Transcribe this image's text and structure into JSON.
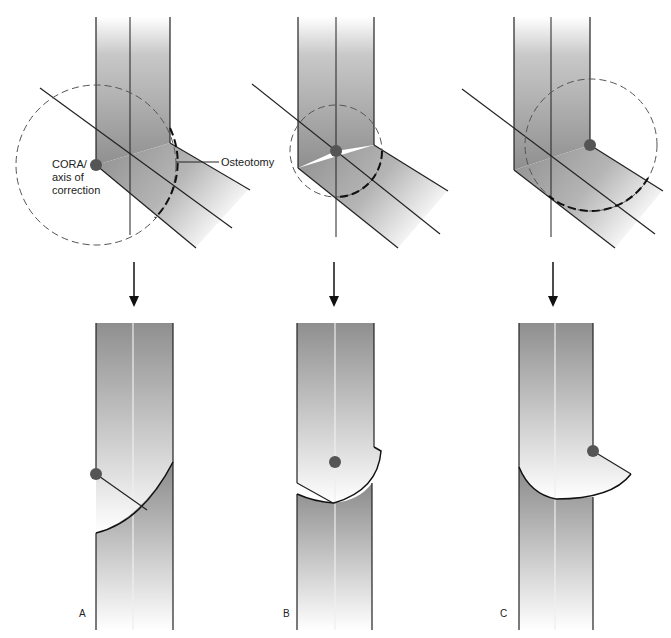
{
  "figure": {
    "labels": {
      "cora_line1": "CORA/",
      "cora_line2": "axis of",
      "cora_line3": "correction",
      "osteotomy": "Osteotomy"
    },
    "panels": [
      {
        "id": "A",
        "label": "A"
      },
      {
        "id": "B",
        "label": "B"
      },
      {
        "id": "C",
        "label": "C"
      }
    ],
    "colors": {
      "bone_dark": "#8a8a8a",
      "bone_light": "#ffffff",
      "outline": "#111111",
      "cora_dot": "#555555"
    }
  }
}
